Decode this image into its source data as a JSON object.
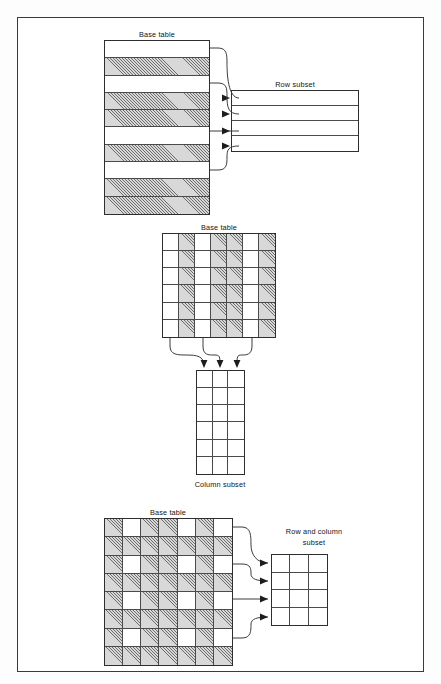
{
  "figure": {
    "title_visible": false,
    "frame": {
      "border_color": "#3a3a3d"
    },
    "hatch_color": "#6d6d6d",
    "line_color": "#3c3c3e"
  },
  "panels": [
    {
      "id": "row-subset",
      "source_label": "Base table",
      "result_label": "Row subset",
      "source": {
        "type": "row-striped-table",
        "columns": 1,
        "rows": 10,
        "row_fill": [
          "white",
          "hatched",
          "white",
          "hatched",
          "hatched",
          "white",
          "hatched",
          "white",
          "hatched",
          "hatched"
        ],
        "selected_rows": [
          1,
          3,
          6,
          8
        ]
      },
      "result": {
        "columns": 1,
        "rows": 4,
        "fill": "white"
      },
      "connector_count": 4,
      "connector_direction": "left-to-right"
    },
    {
      "id": "column-subset",
      "source_label": "Base table",
      "result_label": "Column subset",
      "source": {
        "type": "grid",
        "columns": 7,
        "rows": 6,
        "column_fill": [
          "white",
          "hatched",
          "white",
          "hatched",
          "hatched",
          "white",
          "hatched"
        ],
        "selected_columns": [
          1,
          3,
          6
        ]
      },
      "result": {
        "columns": 3,
        "rows": 6,
        "fill": "white"
      },
      "connector_count": 3,
      "connector_direction": "top-to-bottom"
    },
    {
      "id": "row-and-column-subset",
      "source_label": "Base table",
      "result_label": "Row and column subset",
      "result_label_line1": "Row and column",
      "result_label_line2": "subset",
      "source": {
        "type": "grid",
        "columns": 7,
        "rows": 8,
        "selected_columns": [
          2,
          5,
          7
        ],
        "selected_rows": [
          1,
          3,
          5,
          7
        ],
        "cell_note": "cells at intersection of selected rows and selected columns are white; all others hatched"
      },
      "result": {
        "columns": 3,
        "rows": 4,
        "fill": "white"
      },
      "connector_count": 4,
      "connector_direction": "left-to-right"
    }
  ]
}
